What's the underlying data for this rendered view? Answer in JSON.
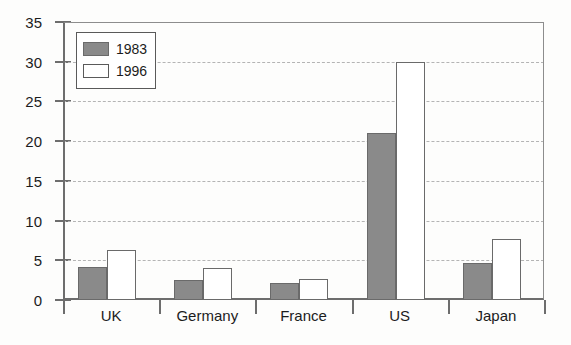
{
  "chart_data": {
    "type": "bar",
    "title": "",
    "xlabel": "",
    "ylabel": "",
    "categories": [
      "UK",
      "Germany",
      "France",
      "US",
      "Japan"
    ],
    "series": [
      {
        "name": "1983",
        "color": "#8a8a8a",
        "values": [
          4.1,
          2.5,
          2.1,
          21.0,
          4.6
        ]
      },
      {
        "name": "1996",
        "color": "#ffffff",
        "values": [
          6.3,
          4.0,
          2.6,
          30.0,
          7.7
        ]
      }
    ],
    "ylim": [
      0,
      35
    ],
    "yticks": [
      0,
      5,
      10,
      15,
      20,
      25,
      30,
      35
    ],
    "ytick_labels": [
      "0",
      "5",
      "10",
      "15",
      "20",
      "25",
      "30",
      "35"
    ],
    "grid": true,
    "grid_axis": "y",
    "grid_style": "dashed",
    "legend_position": "top-left",
    "legend_entries": [
      "1983",
      "1996"
    ]
  },
  "axis": {
    "y_tick_labels": [
      "35",
      "30",
      "25",
      "20",
      "15",
      "10",
      "5",
      "0"
    ],
    "x_tick_labels": [
      "UK",
      "Germany",
      "France",
      "US",
      "Japan"
    ]
  },
  "legend": {
    "items": [
      {
        "label": "1983"
      },
      {
        "label": "1996"
      }
    ]
  }
}
